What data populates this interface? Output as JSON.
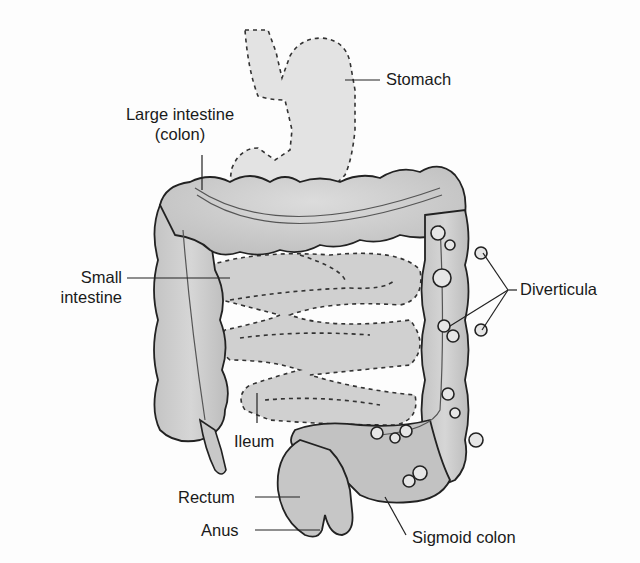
{
  "diagram": {
    "colors": {
      "organ_fill": "#d2d2d2",
      "organ_shade": "#b9b9b9",
      "outline": "#222222",
      "background": "#fdfdfd",
      "text": "#1a1a1a"
    },
    "labels": {
      "stomach": "Stomach",
      "large_intestine_line1": "Large intestine",
      "large_intestine_line2": "(colon)",
      "small_intestine_line1": "Small",
      "small_intestine_line2": "intestine",
      "diverticula": "Diverticula",
      "ileum": "Ileum",
      "rectum": "Rectum",
      "anus": "Anus",
      "sigmoid_colon": "Sigmoid colon"
    }
  }
}
